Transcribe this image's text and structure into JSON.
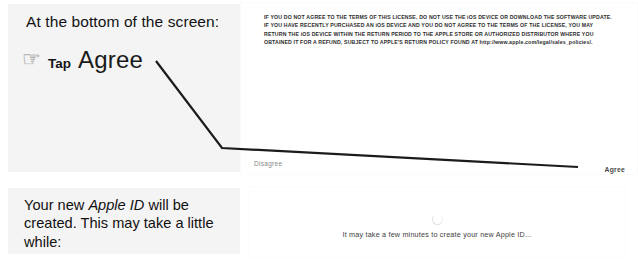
{
  "annotations": {
    "top": {
      "heading": "At the bottom of the screen:",
      "hand_icon": "pointing-hand-icon",
      "tap_label": "Tap",
      "target_label": "Agree"
    },
    "bottom": {
      "text_before": "Your new ",
      "text_emphasis": "Apple ID",
      "text_after": " will be created. This may take a little while:"
    }
  },
  "device_screens": {
    "license": {
      "body_text": "IF YOU DO NOT AGREE TO THE TERMS OF THIS LICENSE, DO NOT USE THE iOS DEVICE OR DOWNLOAD THE SOFTWARE UPDATE. IF YOU HAVE RECENTLY PURCHASED AN iOS DEVICE AND YOU DO NOT AGREE TO THE TERMS OF THE LICENSE, YOU MAY RETURN THE iOS DEVICE WITHIN THE RETURN PERIOD TO THE APPLE STORE OR AUTHORIZED DISTRIBUTOR WHERE YOU OBTAINED IT FOR A REFUND, SUBJECT TO APPLE'S RETURN POLICY FOUND AT http://www.apple.com/legal/sales_policies/.",
      "disagree_label": "Disagree",
      "agree_label": "Agree"
    },
    "creating": {
      "spinner_icon": "loading-spinner-icon",
      "status_text": "It may take a few minutes to create your new Apple ID..."
    }
  },
  "colors": {
    "annotation_card": "#f4f4f4",
    "device_panel": "#ffffff",
    "leader_line": "#1b1b1b",
    "license_text": "#2c2c2c",
    "disagree_text": "#8a8a8a"
  }
}
